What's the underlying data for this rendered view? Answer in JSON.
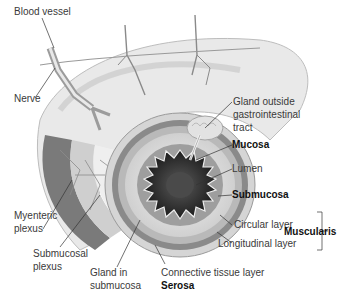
{
  "figure": {
    "labels": {
      "blood_vessel": "Blood vessel",
      "nerve": "Nerve",
      "gland_outside_1": "Gland outside",
      "gland_outside_2": "gastrointestinal",
      "gland_outside_3": "tract",
      "mucosa": "Mucosa",
      "lumen": "Lumen",
      "submucosa": "Submucosa",
      "circular_layer": "Circular layer",
      "longitudinal_layer": "Longitudinal layer",
      "muscularis": "Muscularis",
      "myenteric_1": "Myenteric",
      "myenteric_2": "plexus",
      "submucosal_1": "Submucosal",
      "submucosal_2": "plexus",
      "gland_in_1": "Gland in",
      "gland_in_2": "submucosa",
      "connective": "Connective tissue layer",
      "serosa": "Serosa"
    },
    "colors": {
      "tissue_light": "#e6e6e6",
      "tissue_mid": "#bdbdbd",
      "tissue_dark": "#555555",
      "lumen": "#2b2b2b",
      "leader_line": "#333333"
    }
  }
}
